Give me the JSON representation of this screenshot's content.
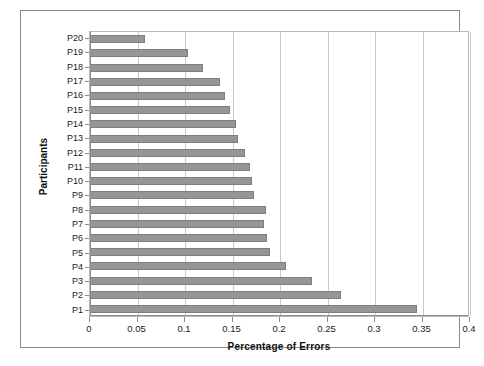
{
  "chart_data": {
    "type": "bar",
    "orientation": "horizontal",
    "title": "",
    "xlabel": "Percentage of Errors",
    "ylabel": "Participants",
    "xlim": [
      0,
      0.4
    ],
    "xticks": [
      0,
      0.05,
      0.1,
      0.15,
      0.2,
      0.25,
      0.3,
      0.35,
      0.4
    ],
    "xtick_labels": [
      "0",
      "0.05",
      "0.1",
      "0.15",
      "0.2",
      "0.25",
      "0.3",
      "0.35",
      "0.4"
    ],
    "grid": "vertical",
    "legend": "none",
    "bar_color": "#969696",
    "bar_edge_color": "#7e7e7e",
    "categories": [
      "P20",
      "P19",
      "P18",
      "P17",
      "P16",
      "P15",
      "P14",
      "P13",
      "P12",
      "P11",
      "P10",
      "P9",
      "P8",
      "P7",
      "P6",
      "P5",
      "P4",
      "P3",
      "P2",
      "P1"
    ],
    "values": [
      0.058,
      0.103,
      0.119,
      0.137,
      0.142,
      0.147,
      0.154,
      0.156,
      0.163,
      0.168,
      0.17,
      0.173,
      0.185,
      0.183,
      0.186,
      0.189,
      0.206,
      0.234,
      0.264,
      0.344
    ]
  },
  "axes": {
    "x_title": "Percentage of Errors",
    "y_title": "Participants"
  }
}
